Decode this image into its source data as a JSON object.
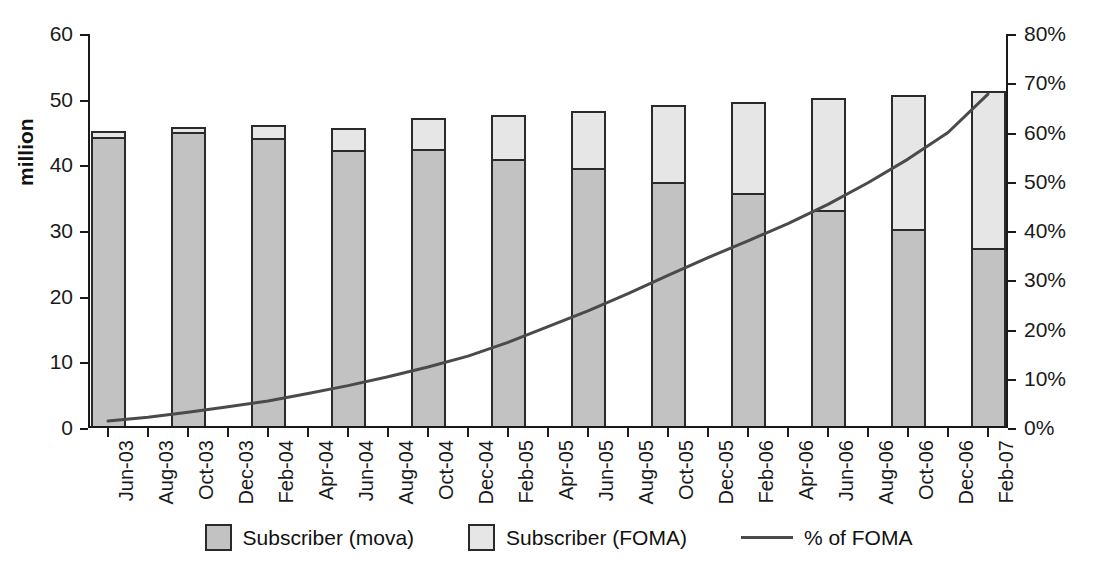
{
  "chart_data": {
    "type": "bar",
    "subtype": "stacked-bar-with-line",
    "title": "",
    "xlabel": "",
    "ylabel": "million",
    "ylim": [
      0,
      60
    ],
    "y2lim": [
      0,
      80
    ],
    "y2label": "",
    "grid": false,
    "legend_position": "bottom",
    "left_axis_ticks": [
      "0",
      "10",
      "20",
      "30",
      "40",
      "50",
      "60"
    ],
    "left_axis_values": [
      0,
      10,
      20,
      30,
      40,
      50,
      60
    ],
    "right_axis_ticks": [
      "0%",
      "10%",
      "20%",
      "30%",
      "40%",
      "50%",
      "60%",
      "70%",
      "80%"
    ],
    "right_axis_values": [
      0,
      10,
      20,
      30,
      40,
      50,
      60,
      70,
      80
    ],
    "tick_labels": [
      "Jun-03",
      "Aug-03",
      "Oct-03",
      "Dec-03",
      "Feb-04",
      "Apr-04",
      "Jun-04",
      "Aug-04",
      "Oct-04",
      "Dec-04",
      "Feb-05",
      "Apr-05",
      "Jun-05",
      "Aug-05",
      "Oct-05",
      "Dec-05",
      "Feb-06",
      "Apr-06",
      "Jun-06",
      "Aug-06",
      "Oct-06",
      "Dec-06",
      "Feb-07"
    ],
    "categories": [
      "Jun-03",
      "Oct-03",
      "Feb-04",
      "Jun-04",
      "Oct-04",
      "Feb-05",
      "Jun-05",
      "Oct-05",
      "Feb-06",
      "Jun-06",
      "Oct-06",
      "Feb-07"
    ],
    "category_tick_index": [
      0,
      2,
      4,
      6,
      8,
      10,
      12,
      14,
      16,
      18,
      20,
      22
    ],
    "series": [
      {
        "name": "Subscriber (mova)",
        "color": "#c2c2c2",
        "axis": "left",
        "values": [
          44.3,
          45.0,
          44.2,
          42.3,
          42.4,
          41.0,
          39.6,
          37.4,
          35.7,
          33.1,
          30.2,
          27.3
        ]
      },
      {
        "name": "Subscriber (FOMA)",
        "color": "#e6e6e6",
        "axis": "left",
        "values": [
          0.6,
          0.5,
          1.7,
          3.1,
          4.5,
          6.3,
          8.4,
          11.5,
          13.7,
          16.8,
          20.2,
          23.7
        ]
      }
    ],
    "totals": [
      44.9,
      45.5,
      45.9,
      45.4,
      46.9,
      47.3,
      48.0,
      48.9,
      49.4,
      49.9,
      50.4,
      51.0
    ],
    "line_series": {
      "name": "% of FOMA",
      "color": "#4a4a4a",
      "axis": "right",
      "x": [
        "Jun-03",
        "Aug-03",
        "Oct-03",
        "Dec-03",
        "Feb-04",
        "Apr-04",
        "Jun-04",
        "Aug-04",
        "Oct-04",
        "Dec-04",
        "Feb-05",
        "Apr-05",
        "Jun-05",
        "Aug-05",
        "Oct-05",
        "Dec-05",
        "Feb-06",
        "Apr-06",
        "Jun-06",
        "Aug-06",
        "Oct-06",
        "Dec-06",
        "Feb-07"
      ],
      "values": [
        1.4,
        2.2,
        3.2,
        4.3,
        5.5,
        7.0,
        8.6,
        10.4,
        12.4,
        14.6,
        17.4,
        20.6,
        23.8,
        27.3,
        31.0,
        34.6,
        38.0,
        41.5,
        45.4,
        49.8,
        54.6,
        60.0,
        67.8
      ]
    }
  },
  "legend": {
    "items": [
      {
        "label": "Subscriber (mova)",
        "swatch": "mova",
        "kind": "swatch"
      },
      {
        "label": "Subscriber (FOMA)",
        "swatch": "foma",
        "kind": "swatch"
      },
      {
        "label": "% of FOMA",
        "swatch": "line",
        "kind": "line"
      }
    ]
  },
  "colors": {
    "mova": "#c2c2c2",
    "foma": "#e6e6e6",
    "line": "#4a4a4a",
    "axis": "#1a1a1a",
    "background": "#ffffff"
  }
}
